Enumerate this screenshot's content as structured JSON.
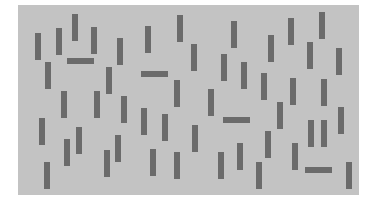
{
  "stimulus": {
    "type": "visual-search-display",
    "panel": {
      "x": 18,
      "y": 5,
      "w": 341,
      "h": 190,
      "color": "#c3c3c3"
    },
    "bar_color": "#6b6b6b",
    "bar_size": {
      "long": 27,
      "short": 6
    },
    "bars": [
      {
        "x": 35,
        "y": 33,
        "o": "v"
      },
      {
        "x": 56,
        "y": 28,
        "o": "v"
      },
      {
        "x": 72,
        "y": 14,
        "o": "v"
      },
      {
        "x": 91,
        "y": 27,
        "o": "v"
      },
      {
        "x": 67,
        "y": 58,
        "o": "h"
      },
      {
        "x": 45,
        "y": 62,
        "o": "v"
      },
      {
        "x": 61,
        "y": 91,
        "o": "v"
      },
      {
        "x": 94,
        "y": 91,
        "o": "v"
      },
      {
        "x": 39,
        "y": 118,
        "o": "v"
      },
      {
        "x": 64,
        "y": 139,
        "o": "v"
      },
      {
        "x": 76,
        "y": 127,
        "o": "v"
      },
      {
        "x": 44,
        "y": 162,
        "o": "v"
      },
      {
        "x": 104,
        "y": 150,
        "o": "v"
      },
      {
        "x": 115,
        "y": 135,
        "o": "v"
      },
      {
        "x": 117,
        "y": 38,
        "o": "v"
      },
      {
        "x": 145,
        "y": 26,
        "o": "v"
      },
      {
        "x": 177,
        "y": 15,
        "o": "v"
      },
      {
        "x": 191,
        "y": 44,
        "o": "v"
      },
      {
        "x": 106,
        "y": 67,
        "o": "v"
      },
      {
        "x": 141,
        "y": 71,
        "o": "h"
      },
      {
        "x": 174,
        "y": 80,
        "o": "v"
      },
      {
        "x": 121,
        "y": 96,
        "o": "v"
      },
      {
        "x": 141,
        "y": 108,
        "o": "v"
      },
      {
        "x": 162,
        "y": 114,
        "o": "v"
      },
      {
        "x": 150,
        "y": 149,
        "o": "v"
      },
      {
        "x": 174,
        "y": 152,
        "o": "v"
      },
      {
        "x": 192,
        "y": 125,
        "o": "v"
      },
      {
        "x": 231,
        "y": 21,
        "o": "v"
      },
      {
        "x": 268,
        "y": 35,
        "o": "v"
      },
      {
        "x": 221,
        "y": 54,
        "o": "v"
      },
      {
        "x": 241,
        "y": 62,
        "o": "v"
      },
      {
        "x": 261,
        "y": 73,
        "o": "v"
      },
      {
        "x": 208,
        "y": 89,
        "o": "v"
      },
      {
        "x": 288,
        "y": 18,
        "o": "v"
      },
      {
        "x": 319,
        "y": 12,
        "o": "v"
      },
      {
        "x": 307,
        "y": 42,
        "o": "v"
      },
      {
        "x": 336,
        "y": 48,
        "o": "v"
      },
      {
        "x": 290,
        "y": 78,
        "o": "v"
      },
      {
        "x": 321,
        "y": 79,
        "o": "v"
      },
      {
        "x": 223,
        "y": 117,
        "o": "h"
      },
      {
        "x": 277,
        "y": 102,
        "o": "v"
      },
      {
        "x": 237,
        "y": 143,
        "o": "v"
      },
      {
        "x": 265,
        "y": 131,
        "o": "v"
      },
      {
        "x": 218,
        "y": 152,
        "o": "v"
      },
      {
        "x": 256,
        "y": 162,
        "o": "v"
      },
      {
        "x": 308,
        "y": 120,
        "o": "v"
      },
      {
        "x": 321,
        "y": 120,
        "o": "v"
      },
      {
        "x": 338,
        "y": 107,
        "o": "v"
      },
      {
        "x": 292,
        "y": 143,
        "o": "v"
      },
      {
        "x": 305,
        "y": 167,
        "o": "h"
      },
      {
        "x": 346,
        "y": 162,
        "o": "v"
      }
    ]
  }
}
